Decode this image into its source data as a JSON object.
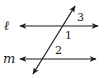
{
  "figure": {
    "type": "parallel-lines-transversal",
    "lines": [
      {
        "id": "l",
        "label": "ℓ",
        "y": 26,
        "x1": 20,
        "x2": 98
      },
      {
        "id": "m",
        "label": "m",
        "y": 59,
        "x1": 20,
        "x2": 96
      }
    ],
    "transversal": {
      "x1": 33,
      "y1": 74,
      "x2": 75,
      "y2": 6
    },
    "angles": [
      {
        "label": "3",
        "x": 77,
        "y": 21
      },
      {
        "label": "1",
        "x": 65,
        "y": 39
      },
      {
        "label": "2",
        "x": 55,
        "y": 54
      }
    ],
    "colors": {
      "stroke": "#1a1a1a",
      "background": "#ffffff"
    }
  }
}
